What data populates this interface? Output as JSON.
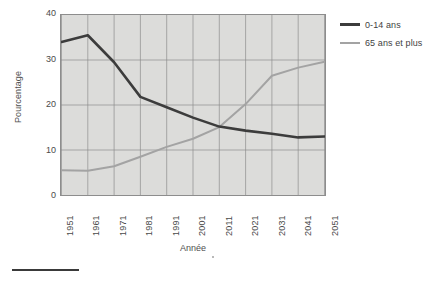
{
  "chart_data": {
    "type": "line",
    "title": "",
    "xlabel": "Année",
    "ylabel": "Pourcentage",
    "categories": [
      "1951",
      "1961",
      "1971",
      "1981",
      "1991",
      "2001",
      "2011",
      "2021",
      "2031",
      "2041",
      "2051"
    ],
    "x": [
      1951,
      1961,
      1971,
      1981,
      1991,
      2001,
      2011,
      2021,
      2031,
      2041,
      2051
    ],
    "xlim": [
      1951,
      2051
    ],
    "ylim": [
      0,
      40
    ],
    "yticks": [
      "40",
      "30",
      "20",
      "10",
      "0"
    ],
    "ytick_values": [
      40,
      30,
      20,
      10,
      0
    ],
    "grid": true,
    "legend_position": "right",
    "series": [
      {
        "name": "0-14 ans",
        "color": "#3c3c3c",
        "values": [
          34.0,
          35.5,
          29.5,
          21.8,
          19.5,
          17.2,
          15.2,
          14.3,
          13.6,
          12.8,
          13.0
        ]
      },
      {
        "name": "65 ans et plus",
        "color": "#a3a3a3",
        "values": [
          5.5,
          5.4,
          6.4,
          8.5,
          10.7,
          12.5,
          15.1,
          20.2,
          26.5,
          28.3,
          29.6
        ]
      }
    ]
  },
  "legend": {
    "items": [
      {
        "label": "0-14 ans",
        "swatch": "dark-line-swatch"
      },
      {
        "label": "65 ans et plus",
        "swatch": "gray-line-swatch"
      }
    ]
  },
  "axes": {
    "y_title": "Pourcentage",
    "x_title": "Année"
  },
  "colors": {
    "plot_background": "#dcdcda",
    "grid": "#8d8d8d",
    "series_0": "#3c3c3c",
    "series_1": "#a3a3a3",
    "text": "#3f3f3f"
  }
}
